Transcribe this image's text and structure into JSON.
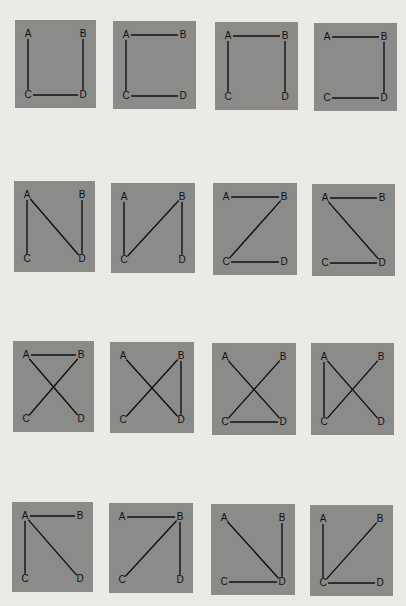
{
  "figure": {
    "colors": {
      "page_background": "#ecebe8",
      "panel_fill": "#8b8b8a",
      "edge_stroke": "#111111",
      "label_color": "#111111"
    },
    "node_labels": [
      "A",
      "B",
      "C",
      "D"
    ],
    "panels": [
      {
        "id": "r1c1",
        "row": 1,
        "col": 1,
        "box": [
          15,
          20,
          81,
          88
        ],
        "edges": [
          [
            "A",
            "C"
          ],
          [
            "B",
            "D"
          ],
          [
            "C",
            "D"
          ]
        ]
      },
      {
        "id": "r1c2",
        "row": 1,
        "col": 2,
        "box": [
          113,
          21,
          83,
          88
        ],
        "edges": [
          [
            "A",
            "B"
          ],
          [
            "A",
            "C"
          ],
          [
            "C",
            "D"
          ]
        ]
      },
      {
        "id": "r1c3",
        "row": 1,
        "col": 3,
        "box": [
          215,
          22,
          83,
          88
        ],
        "edges": [
          [
            "A",
            "B"
          ],
          [
            "A",
            "C"
          ],
          [
            "B",
            "D"
          ]
        ]
      },
      {
        "id": "r1c4",
        "row": 1,
        "col": 4,
        "box": [
          314,
          23,
          83,
          88
        ],
        "edges": [
          [
            "A",
            "B"
          ],
          [
            "B",
            "D"
          ],
          [
            "C",
            "D"
          ]
        ]
      },
      {
        "id": "r2c1",
        "row": 2,
        "col": 1,
        "box": [
          14,
          181,
          81,
          91
        ],
        "edges": [
          [
            "A",
            "C"
          ],
          [
            "A",
            "D"
          ],
          [
            "B",
            "D"
          ]
        ]
      },
      {
        "id": "r2c2",
        "row": 2,
        "col": 2,
        "box": [
          111,
          183,
          84,
          90
        ],
        "edges": [
          [
            "A",
            "C"
          ],
          [
            "B",
            "C"
          ],
          [
            "B",
            "D"
          ]
        ]
      },
      {
        "id": "r2c3",
        "row": 2,
        "col": 3,
        "box": [
          213,
          183,
          84,
          92
        ],
        "edges": [
          [
            "A",
            "B"
          ],
          [
            "B",
            "C"
          ],
          [
            "C",
            "D"
          ]
        ]
      },
      {
        "id": "r2c4",
        "row": 2,
        "col": 4,
        "box": [
          312,
          184,
          83,
          92
        ],
        "edges": [
          [
            "A",
            "B"
          ],
          [
            "A",
            "D"
          ],
          [
            "C",
            "D"
          ]
        ]
      },
      {
        "id": "r3c1",
        "row": 3,
        "col": 1,
        "box": [
          13,
          341,
          81,
          91
        ],
        "edges": [
          [
            "A",
            "B"
          ],
          [
            "A",
            "D"
          ],
          [
            "B",
            "C"
          ]
        ]
      },
      {
        "id": "r3c2",
        "row": 3,
        "col": 2,
        "box": [
          110,
          342,
          84,
          91
        ],
        "edges": [
          [
            "A",
            "D"
          ],
          [
            "B",
            "C"
          ],
          [
            "B",
            "D"
          ]
        ]
      },
      {
        "id": "r3c3",
        "row": 3,
        "col": 3,
        "box": [
          212,
          343,
          84,
          92
        ],
        "edges": [
          [
            "A",
            "D"
          ],
          [
            "B",
            "C"
          ],
          [
            "C",
            "D"
          ]
        ]
      },
      {
        "id": "r3c4",
        "row": 3,
        "col": 4,
        "box": [
          311,
          343,
          83,
          92
        ],
        "edges": [
          [
            "A",
            "C"
          ],
          [
            "A",
            "D"
          ],
          [
            "B",
            "C"
          ]
        ]
      },
      {
        "id": "r4c1",
        "row": 4,
        "col": 1,
        "box": [
          12,
          502,
          81,
          90
        ],
        "edges": [
          [
            "A",
            "B"
          ],
          [
            "A",
            "C"
          ],
          [
            "A",
            "D"
          ]
        ]
      },
      {
        "id": "r4c2",
        "row": 4,
        "col": 2,
        "box": [
          109,
          503,
          84,
          90
        ],
        "edges": [
          [
            "A",
            "B"
          ],
          [
            "B",
            "C"
          ],
          [
            "B",
            "D"
          ]
        ]
      },
      {
        "id": "r4c3",
        "row": 4,
        "col": 3,
        "box": [
          211,
          504,
          84,
          91
        ],
        "edges": [
          [
            "A",
            "D"
          ],
          [
            "B",
            "D"
          ],
          [
            "C",
            "D"
          ]
        ]
      },
      {
        "id": "r4c4",
        "row": 4,
        "col": 4,
        "box": [
          310,
          505,
          83,
          91
        ],
        "edges": [
          [
            "A",
            "C"
          ],
          [
            "B",
            "C"
          ],
          [
            "C",
            "D"
          ]
        ]
      }
    ]
  }
}
